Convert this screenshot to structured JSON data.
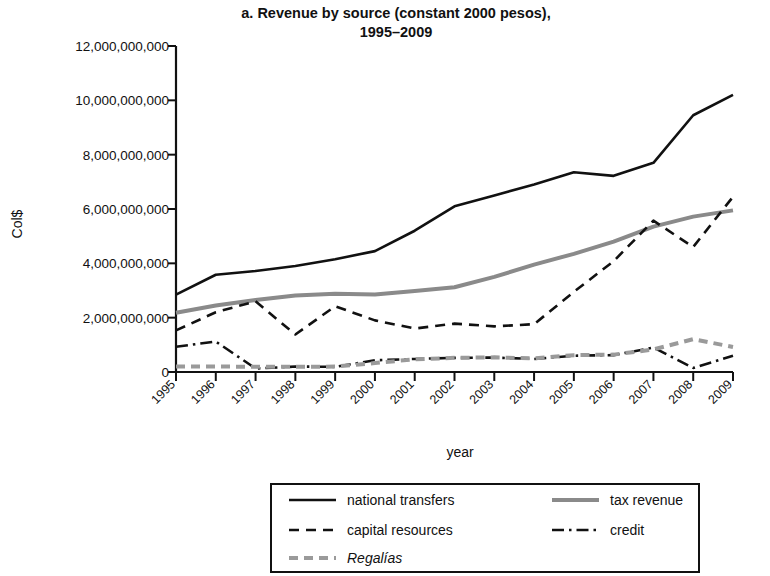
{
  "chart_data": {
    "type": "line",
    "title": "a. Revenue by source (constant 2000 pesos), 1995–2009",
    "title_line1": "a. Revenue by source (constant 2000 pesos),",
    "title_line2": "1995–2009",
    "xlabel": "year",
    "ylabel": "Col$",
    "x": [
      1995,
      1996,
      1997,
      1998,
      1999,
      2000,
      2001,
      2002,
      2003,
      2004,
      2005,
      2006,
      2007,
      2008,
      2009
    ],
    "xtick_labels": [
      "1995",
      "1996",
      "1997",
      "1998",
      "1999",
      "2000",
      "2001",
      "2002",
      "2003",
      "2004",
      "2005",
      "2006",
      "2007",
      "2008",
      "2009"
    ],
    "ytick_labels": [
      "0",
      "2,000,000,000",
      "4,000,000,000",
      "6,000,000,000",
      "8,000,000,000",
      "10,000,000,000",
      "12,000,000,000"
    ],
    "ytick_values": [
      0,
      2000000000,
      4000000000,
      6000000000,
      8000000000,
      10000000000,
      12000000000
    ],
    "ylim": [
      0,
      12000000000
    ],
    "xlim": [
      1995,
      2009
    ],
    "grid": false,
    "legend_position": "below",
    "series": [
      {
        "name": "national transfers",
        "style": "solid",
        "color": "#111111",
        "width": 2.6,
        "values": [
          2850000000,
          3580000000,
          3720000000,
          3900000000,
          4150000000,
          4450000000,
          5200000000,
          6100000000,
          6500000000,
          6900000000,
          7350000000,
          7220000000,
          7700000000,
          9450000000,
          10200000000
        ]
      },
      {
        "name": "tax revenue",
        "style": "solid",
        "color": "#8a8a8a",
        "width": 4.0,
        "values": [
          2180000000,
          2450000000,
          2650000000,
          2820000000,
          2880000000,
          2850000000,
          2980000000,
          3120000000,
          3500000000,
          3950000000,
          4350000000,
          4800000000,
          5350000000,
          5720000000,
          5950000000
        ]
      },
      {
        "name": "capital resources",
        "style": "dashed",
        "color": "#111111",
        "width": 2.6,
        "values": [
          1530000000,
          2200000000,
          2600000000,
          1380000000,
          2420000000,
          1900000000,
          1600000000,
          1780000000,
          1680000000,
          1760000000,
          2950000000,
          4080000000,
          5570000000,
          4600000000,
          6450000000
        ]
      },
      {
        "name": "credit",
        "style": "dashdot",
        "color": "#111111",
        "width": 2.6,
        "values": [
          930000000,
          1120000000,
          130000000,
          200000000,
          190000000,
          430000000,
          480000000,
          520000000,
          530000000,
          480000000,
          600000000,
          620000000,
          900000000,
          150000000,
          600000000
        ]
      },
      {
        "name": "Regalías",
        "style": "dashed",
        "color": "#9a9a9a",
        "width": 4.0,
        "italic": true,
        "values": [
          200000000,
          200000000,
          195000000,
          190000000,
          200000000,
          330000000,
          470000000,
          520000000,
          540000000,
          500000000,
          620000000,
          640000000,
          830000000,
          1210000000,
          920000000
        ]
      }
    ]
  },
  "legend": {
    "entries": [
      {
        "label": "national transfers",
        "series": 0
      },
      {
        "label": "tax revenue",
        "series": 1
      },
      {
        "label": "capital resources",
        "series": 2
      },
      {
        "label": "credit",
        "series": 3
      },
      {
        "label": "Regalías",
        "series": 4
      }
    ]
  }
}
